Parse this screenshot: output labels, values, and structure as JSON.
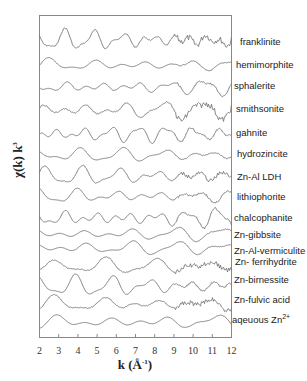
{
  "chart_data": {
    "type": "line",
    "title": "",
    "xlabel": "k (Å-1)",
    "ylabel": "χ(k) k3",
    "xlim": [
      2,
      12
    ],
    "x_ticks": [
      "2",
      "3",
      "4",
      "5",
      "6",
      "7",
      "8",
      "9",
      "10",
      "11",
      "12"
    ],
    "grid": false,
    "legend_position": "inline-right",
    "series": [
      {
        "name": "franklinite",
        "baseline_y": 40,
        "amp": 9,
        "freq": 1.9,
        "phase": 0.3,
        "noise": 3
      },
      {
        "name": "hemimorphite",
        "baseline_y": 65,
        "amp": 6,
        "freq": 1.2,
        "phase": 1.1,
        "noise": 0.5
      },
      {
        "name": "sphalerite",
        "baseline_y": 87,
        "amp": 7,
        "freq": 1.6,
        "phase": 2.0,
        "noise": 1
      },
      {
        "name": "smithsonite",
        "baseline_y": 110,
        "amp": 8,
        "freq": 1.4,
        "phase": 0.7,
        "noise": 3
      },
      {
        "name": "gahnite",
        "baseline_y": 134,
        "amp": 7,
        "freq": 2.0,
        "phase": 1.5,
        "noise": 0.8
      },
      {
        "name": "hydrozincite",
        "baseline_y": 155,
        "amp": 6,
        "freq": 1.3,
        "phase": 2.4,
        "noise": 0.5
      },
      {
        "name": "Zn-Al LDH",
        "baseline_y": 176,
        "amp": 8,
        "freq": 1.5,
        "phase": 0.2,
        "noise": 2
      },
      {
        "name": "lithiophorite",
        "baseline_y": 196,
        "amp": 7,
        "freq": 1.4,
        "phase": 1.9,
        "noise": 1
      },
      {
        "name": "chalcophanite",
        "baseline_y": 218,
        "amp": 9,
        "freq": 1.8,
        "phase": 0.9,
        "noise": 1
      },
      {
        "name": "Zn-gibbsite",
        "baseline_y": 234,
        "amp": 6,
        "freq": 1.2,
        "phase": 2.7,
        "noise": 0.3
      },
      {
        "name": "Zn-Al-vermiculite",
        "baseline_y": 248,
        "amp": 6,
        "freq": 1.2,
        "phase": 2.5,
        "noise": 0.3
      },
      {
        "name": "Zn- ferrihydrite",
        "baseline_y": 266,
        "amp": 7,
        "freq": 1.1,
        "phase": 1.0,
        "noise": 2.5
      },
      {
        "name": "Zn-birnessite",
        "baseline_y": 286,
        "amp": 9,
        "freq": 1.5,
        "phase": 1.4,
        "noise": 1
      },
      {
        "name": "Zn-fulvic acid",
        "baseline_y": 304,
        "amp": 7,
        "freq": 1.1,
        "phase": 1.0,
        "noise": 2.5
      },
      {
        "name": "aqeuous Zn2+",
        "baseline_y": 322,
        "amp": 7,
        "freq": 1.05,
        "phase": 0.9,
        "noise": 0.2
      }
    ],
    "note": "EXAFS k3-weighted spectra, vertically offset stack; waveform shapes approximated"
  },
  "labels": {
    "franklinite": "franklinite",
    "hemimorphite": "hemimorphite",
    "sphalerite": "sphalerite",
    "smithsonite": "smithsonite",
    "gahnite": "gahnite",
    "hydrozincite": "hydrozincite",
    "znal_ldh": "Zn-Al LDH",
    "lithiophorite": "lithiophorite",
    "chalcophanite": "chalcophanite",
    "zn_gibbsite": "Zn-gibbsite",
    "zn_al_vermiculite": "Zn-Al-vermiculite",
    "zn_ferrihydrite": "Zn- ferrihydrite",
    "zn_birnessite": "Zn-birnessite",
    "zn_fulvic": "Zn-fulvic acid",
    "aqueous_base": "aqeuous Zn",
    "aqueous_sup": "2+"
  },
  "axes": {
    "x_label_main": "k (Å",
    "x_label_sup": "-1",
    "x_label_close": ")",
    "y_label_main": "χ(k)  k",
    "y_label_sup": "3",
    "ticks": [
      "2",
      "3",
      "4",
      "5",
      "6",
      "7",
      "8",
      "9",
      "10",
      "11",
      "12"
    ]
  },
  "colors": {
    "line": "#777777",
    "frame": "#888888"
  }
}
